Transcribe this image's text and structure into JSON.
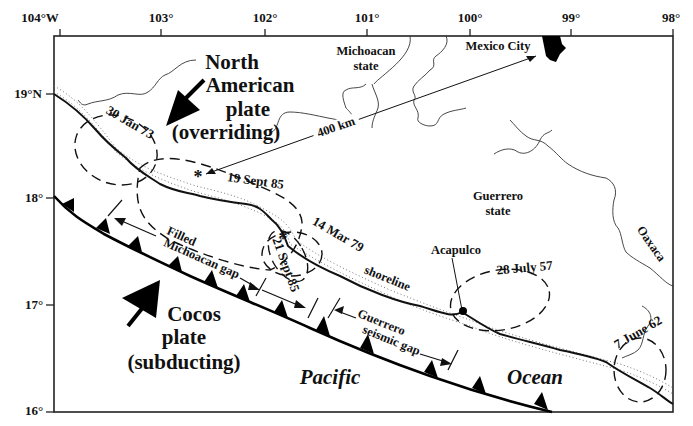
{
  "figure": {
    "type": "tectonic map",
    "region": "Pacific coast of Mexico (Michoacan-Guerrero)",
    "axes": {
      "longitude_ticks": [
        "104°W",
        "103°",
        "102°",
        "101°",
        "100°",
        "99°",
        "98°"
      ],
      "latitude_ticks": [
        "19°N",
        "18°",
        "17°",
        "16°"
      ]
    }
  },
  "labels": {
    "north_american_plate": [
      "North",
      "American",
      "plate",
      "(overriding)"
    ],
    "cocos_plate": [
      "Cocos",
      "plate",
      "(subducting)"
    ],
    "michoacan_state": [
      "Michoacan",
      "state"
    ],
    "guerrero_state": [
      "Guerrero",
      "state"
    ],
    "oaxaca": "Oaxaca",
    "mexico_city": "Mexico City",
    "acapulco": "Acapulco",
    "shoreline": "shoreline",
    "distance": "400 km",
    "pacific": "Pacific",
    "ocean": "Ocean",
    "filled_gap": [
      "Filled",
      "Michoacan gap"
    ],
    "guerrero_gap": [
      "Guerrero",
      "seismic gap"
    ]
  },
  "earthquakes": [
    {
      "label": "30 Jan 73"
    },
    {
      "label": "19 Sept 85"
    },
    {
      "label": "14 Mar 79"
    },
    {
      "label": "21 Sept 85"
    },
    {
      "label": "28 July 57"
    },
    {
      "label": "7 June 62"
    }
  ],
  "colors": {
    "ink": "#111111",
    "background": "#ffffff",
    "shelf_stipple": "#777777"
  }
}
